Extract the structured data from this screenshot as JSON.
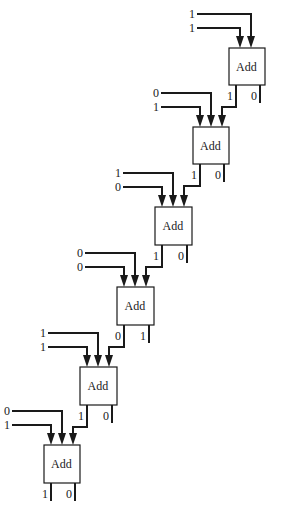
{
  "diagram": {
    "title": "",
    "type": "ripple-carry adder chain",
    "colors": {
      "line": "#1a1a1a",
      "background": "#ffffff"
    },
    "stages": [
      {
        "id": "adder-1",
        "label": "Add",
        "inputs": [
          "1",
          "1"
        ],
        "carry_in": false,
        "carry_out": "1",
        "sum": "0",
        "box": {
          "x": 229,
          "y": 48,
          "w": 36,
          "h": 37
        }
      },
      {
        "id": "adder-2",
        "label": "Add",
        "inputs": [
          "0",
          "1"
        ],
        "carry_in": true,
        "carry_out": "1",
        "sum": "0",
        "box": {
          "x": 193,
          "y": 127,
          "w": 36,
          "h": 37
        }
      },
      {
        "id": "adder-3",
        "label": "Add",
        "inputs": [
          "1",
          "0"
        ],
        "carry_in": true,
        "carry_out": "1",
        "sum": "0",
        "box": {
          "x": 155,
          "y": 207,
          "w": 37,
          "h": 38
        }
      },
      {
        "id": "adder-4",
        "label": "Add",
        "inputs": [
          "0",
          "0"
        ],
        "carry_in": true,
        "carry_out": "0",
        "sum": "1",
        "box": {
          "x": 117,
          "y": 287,
          "w": 37,
          "h": 38
        }
      },
      {
        "id": "adder-5",
        "label": "Add",
        "inputs": [
          "1",
          "1"
        ],
        "carry_in": true,
        "carry_out": "1",
        "sum": "0",
        "box": {
          "x": 80,
          "y": 367,
          "w": 37,
          "h": 38
        }
      },
      {
        "id": "adder-6",
        "label": "Add",
        "inputs": [
          "0",
          "1"
        ],
        "carry_in": true,
        "carry_out": "1",
        "sum": "0",
        "box": {
          "x": 44,
          "y": 445,
          "w": 36,
          "h": 38
        }
      }
    ]
  }
}
